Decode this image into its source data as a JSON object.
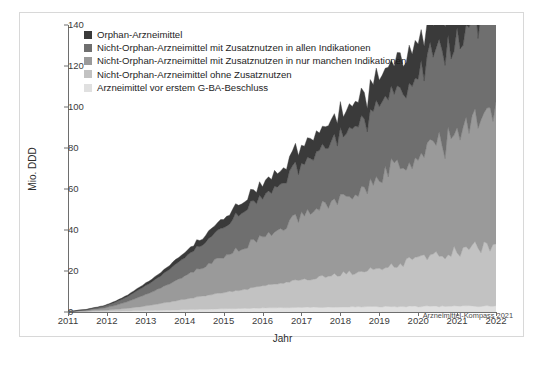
{
  "chart_data": {
    "type": "area",
    "stacked": true,
    "title": "",
    "xlabel": "Jahr",
    "ylabel": "Mio. DDD",
    "ylim": [
      0,
      140
    ],
    "ytick_values": [
      0,
      20,
      40,
      60,
      80,
      100,
      120,
      140
    ],
    "ytick_labels": [
      "0",
      "20",
      "40",
      "60",
      "80",
      "100",
      "120",
      "140"
    ],
    "xlim": [
      2011,
      2022
    ],
    "xtick_values": [
      2011,
      2012,
      2013,
      2014,
      2015,
      2016,
      2017,
      2018,
      2019,
      2020,
      2021,
      2022
    ],
    "xtick_labels": [
      "2011",
      "2012",
      "2013",
      "2014",
      "2015",
      "2016",
      "2017",
      "2018",
      "2019",
      "2020",
      "2021",
      "2022"
    ],
    "grid": false,
    "legend_position": "top-left",
    "attribution": "Arzneimittel-Kompass 2021",
    "series": [
      {
        "name": "Arzneimittel vor erstem G-BA-Beschluss",
        "color": "#e0e0e0",
        "stack_order": 1,
        "values": [
          0.1,
          0.1,
          0.1,
          0.2,
          0.2,
          0.2,
          0.2,
          0.2,
          0.3,
          0.3,
          0.3,
          0.3,
          0.3,
          0.3,
          0.4,
          0.4,
          0.4,
          0.4,
          0.5,
          0.5,
          0.5,
          0.5,
          0.6,
          0.6,
          0.6,
          0.6,
          0.7,
          0.7,
          0.7,
          0.8,
          0.8,
          0.8,
          0.9,
          0.9,
          0.9,
          1.0,
          1.0,
          1.0,
          1.1,
          1.1,
          1.1,
          1.2,
          1.2,
          1.2,
          1.3,
          1.3,
          1.3,
          1.4,
          1.4,
          1.4,
          1.5,
          1.5,
          1.5,
          1.6,
          1.6,
          1.6,
          1.7,
          1.7,
          1.7,
          1.8,
          1.8,
          1.8,
          1.9,
          1.9,
          1.9,
          2.0,
          2.0,
          2.0,
          2.0,
          2.1,
          2.1,
          2.1,
          2.1,
          2.1,
          2.2,
          2.2,
          2.2,
          2.2,
          2.2,
          2.3,
          2.3,
          2.3,
          2.3,
          2.3,
          2.3,
          2.3,
          2.4,
          2.4,
          2.4,
          2.4,
          2.4,
          2.4,
          2.4,
          2.5,
          2.5,
          2.5,
          2.5,
          2.5,
          2.5,
          2.5,
          2.5,
          2.5,
          2.6,
          2.6,
          2.6,
          2.6,
          2.6,
          2.6,
          2.6,
          2.6,
          2.6,
          2.6,
          2.6,
          2.7,
          2.7,
          2.7,
          2.7,
          2.7,
          2.7,
          2.7,
          2.7,
          2.7,
          2.7,
          2.7,
          2.7,
          2.7,
          2.7,
          2.8,
          2.8,
          2.8,
          2.8,
          2.8,
          2.8,
          2.8,
          2.8,
          2.8,
          2.8,
          2.8,
          2.8,
          2.8,
          2.8,
          2.8,
          2.8,
          2.8
        ]
      },
      {
        "name": "Nicht-Orphan-Arzneimittel ohne Zusatznutzen",
        "color": "#c2c2c2",
        "stack_order": 2,
        "values": [
          0.1,
          0.1,
          0.1,
          0.1,
          0.2,
          0.2,
          0.2,
          0.3,
          0.3,
          0.4,
          0.4,
          0.5,
          0.5,
          0.6,
          0.7,
          0.8,
          0.9,
          1.0,
          1.1,
          1.2,
          1.3,
          1.5,
          1.6,
          1.8,
          1.9,
          2.1,
          2.3,
          2.5,
          2.7,
          2.9,
          3.1,
          3.3,
          3.5,
          3.8,
          4.0,
          4.2,
          4.4,
          4.6,
          4.9,
          5.1,
          5.3,
          5.5,
          5.8,
          6.0,
          6.2,
          6.5,
          6.7,
          6.9,
          7.1,
          7.3,
          7.6,
          7.8,
          8.0,
          8.2,
          8.4,
          8.6,
          8.8,
          9.0,
          9.2,
          9.4,
          9.6,
          9.8,
          10.0,
          10.2,
          10.4,
          10.6,
          10.8,
          11.0,
          11.2,
          11.4,
          11.6,
          11.8,
          12.0,
          12.2,
          12.4,
          12.6,
          12.8,
          13.0,
          13.2,
          13.4,
          13.6,
          13.8,
          14.0,
          14.2,
          14.4,
          14.6,
          14.8,
          15.0,
          15.2,
          15.4,
          15.6,
          15.8,
          16.0,
          16.2,
          16.4,
          16.6,
          16.8,
          17.0,
          17.2,
          17.4,
          17.6,
          17.8,
          18.0,
          18.3,
          18.6,
          18.9,
          19.2,
          19.5,
          19.8,
          20.1,
          20.4,
          20.7,
          21.0,
          21.3,
          21.6,
          21.9,
          22.2,
          22.5,
          22.8,
          23.1,
          23.4,
          23.7,
          24.0,
          24.3,
          24.6,
          24.9,
          25.2,
          25.5,
          25.8,
          26.1,
          26.4,
          26.7,
          27.0,
          27.3,
          27.6,
          27.9,
          28.2,
          28.5,
          28.8,
          29.1,
          29.4,
          29.7,
          30.0,
          30.3
        ]
      },
      {
        "name": "Nicht-Orphan-Arzneimittel mit Zusatznutzen in nur manchen Indikationen",
        "color": "#9a9a9a",
        "stack_order": 3,
        "values": [
          0.1,
          0.1,
          0.2,
          0.2,
          0.3,
          0.3,
          0.4,
          0.5,
          0.6,
          0.7,
          0.8,
          0.9,
          1.1,
          1.3,
          1.5,
          1.7,
          2.0,
          2.3,
          2.6,
          2.9,
          3.2,
          3.6,
          4.0,
          4.4,
          4.8,
          5.2,
          5.6,
          6.0,
          6.4,
          6.8,
          7.2,
          7.6,
          8.0,
          8.4,
          8.8,
          9.2,
          9.6,
          10.0,
          10.5,
          11.0,
          11.5,
          12.0,
          12.5,
          13.0,
          13.5,
          14.0,
          14.5,
          15.0,
          15.5,
          16.0,
          16.5,
          17.0,
          17.5,
          18.0,
          18.5,
          19.0,
          19.5,
          20.0,
          20.5,
          21.0,
          21.5,
          22.0,
          22.5,
          23.0,
          23.5,
          24.0,
          24.5,
          25.0,
          25.5,
          26.0,
          26.5,
          27.0,
          27.5,
          28.0,
          28.5,
          29.0,
          29.5,
          30.0,
          30.5,
          31.0,
          31.5,
          32.0,
          32.5,
          33.0,
          33.5,
          34.0,
          34.5,
          35.0,
          35.5,
          36.0,
          36.5,
          37.0,
          37.5,
          38.0,
          38.5,
          39.0,
          39.5,
          40.0,
          40.5,
          41.0,
          41.5,
          42.0,
          42.5,
          43.0,
          43.5,
          44.0,
          44.5,
          45.0,
          45.5,
          46.0,
          46.5,
          47.0,
          47.5,
          48.0,
          48.5,
          49.0,
          49.5,
          50.0,
          50.5,
          51.0,
          51.5,
          52.0,
          52.5,
          53.0,
          53.5,
          54.0,
          54.5,
          55.0,
          55.5,
          56.0,
          56.5,
          57.0,
          57.5,
          58.0,
          58.5,
          59.0,
          59.5,
          60.0,
          60.5,
          61.0,
          61.5,
          62.0,
          62.5,
          63.0
        ]
      },
      {
        "name": "Nicht-Orphan-Arzneimittel mit Zusatznutzen in allen Indikationen",
        "color": "#6f6f6f",
        "stack_order": 4,
        "values": [
          0.1,
          0.1,
          0.1,
          0.2,
          0.2,
          0.3,
          0.3,
          0.4,
          0.5,
          0.6,
          0.7,
          0.8,
          0.9,
          1.1,
          1.2,
          1.4,
          1.6,
          1.8,
          2.0,
          2.3,
          2.5,
          2.8,
          3.1,
          3.4,
          3.7,
          4.0,
          4.3,
          4.6,
          5.0,
          5.3,
          5.7,
          6.0,
          6.4,
          6.8,
          7.1,
          7.5,
          7.9,
          8.3,
          8.7,
          9.1,
          9.5,
          9.9,
          10.3,
          10.7,
          11.1,
          11.5,
          11.9,
          12.3,
          12.7,
          13.1,
          13.5,
          13.9,
          14.3,
          14.7,
          15.1,
          15.5,
          15.9,
          16.3,
          16.7,
          17.1,
          17.5,
          17.9,
          18.3,
          18.7,
          19.1,
          19.5,
          19.9,
          20.3,
          20.7,
          21.1,
          21.5,
          21.9,
          22.3,
          22.7,
          23.1,
          23.5,
          23.9,
          24.3,
          24.7,
          25.1,
          25.5,
          25.9,
          26.3,
          26.7,
          27.1,
          27.5,
          27.9,
          28.3,
          28.7,
          29.1,
          29.5,
          29.9,
          30.3,
          30.7,
          31.1,
          31.5,
          31.9,
          32.3,
          32.7,
          33.1,
          33.5,
          33.9,
          34.3,
          34.7,
          35.1,
          35.5,
          35.9,
          36.3,
          36.7,
          37.1,
          37.5,
          37.9,
          38.3,
          38.7,
          39.1,
          39.5,
          39.9,
          40.3,
          40.7,
          41.1,
          41.5,
          41.9,
          42.3,
          42.7,
          43.1,
          43.5,
          43.9,
          44.3,
          44.7,
          45.1,
          45.5,
          45.9,
          46.3,
          46.7,
          47.1,
          47.5,
          47.9,
          48.3,
          48.7,
          49.1,
          49.5,
          49.9,
          50.3,
          50.7
        ]
      },
      {
        "name": "Orphan-Arzneimittel",
        "color": "#3a3a3a",
        "stack_order": 5,
        "values": [
          0.0,
          0.0,
          0.0,
          0.1,
          0.1,
          0.1,
          0.1,
          0.2,
          0.2,
          0.2,
          0.3,
          0.3,
          0.3,
          0.4,
          0.4,
          0.5,
          0.5,
          0.6,
          0.6,
          0.7,
          0.8,
          0.8,
          0.9,
          1.0,
          1.1,
          1.1,
          1.2,
          1.3,
          1.4,
          1.5,
          1.6,
          1.7,
          1.8,
          1.9,
          2.0,
          2.1,
          2.2,
          2.3,
          2.4,
          2.5,
          2.6,
          2.7,
          2.8,
          3.0,
          3.1,
          3.2,
          3.3,
          3.5,
          3.6,
          3.7,
          3.9,
          4.0,
          4.1,
          4.3,
          4.4,
          4.6,
          4.7,
          4.9,
          5.0,
          5.2,
          5.3,
          5.5,
          5.6,
          5.8,
          5.9,
          6.1,
          6.3,
          6.4,
          6.6,
          6.8,
          6.9,
          7.1,
          7.3,
          7.4,
          7.6,
          7.8,
          8.0,
          8.1,
          8.3,
          8.5,
          8.7,
          8.9,
          9.0,
          9.2,
          9.4,
          9.6,
          9.8,
          10.0,
          10.2,
          10.4,
          10.6,
          10.8,
          11.0,
          11.2,
          11.4,
          11.6,
          11.8,
          12.0,
          12.2,
          12.4,
          12.6,
          12.8,
          13.0,
          13.2,
          13.4,
          13.6,
          13.8,
          14.0,
          14.2,
          14.4,
          14.6,
          14.8,
          15.0,
          15.2,
          15.4,
          15.6,
          15.8,
          16.0,
          16.2,
          16.4,
          16.6,
          16.8,
          17.0,
          17.2,
          17.4,
          17.6,
          17.8,
          18.0,
          18.2,
          18.4,
          18.6,
          18.8,
          19.0,
          19.2,
          19.4,
          19.6,
          19.8,
          20.0,
          20.2,
          20.4,
          20.6,
          20.8,
          21.0,
          21.2
        ]
      }
    ]
  },
  "legend": {
    "items": [
      {
        "label": "Orphan-Arzneimittel",
        "color": "#3a3a3a"
      },
      {
        "label": "Nicht-Orphan-Arzneimittel mit Zusatznutzen in allen Indikationen",
        "color": "#6f6f6f"
      },
      {
        "label": "Nicht-Orphan-Arzneimittel mit Zusatznutzen in nur manchen Indikationen",
        "color": "#9a9a9a"
      },
      {
        "label": "Nicht-Orphan-Arzneimittel ohne Zusatznutzen",
        "color": "#c2c2c2"
      },
      {
        "label": "Arzneimittel vor erstem G-BA-Beschluss",
        "color": "#e0e0e0"
      }
    ]
  },
  "axes": {
    "y_title": "Mio. DDD",
    "x_title": "Jahr"
  },
  "attribution": "Arzneimittel-Kompass 2021"
}
